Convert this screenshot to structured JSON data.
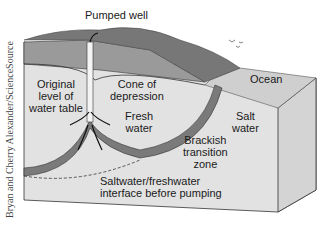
{
  "diagram": {
    "labels": {
      "pumped_well": "Pumped well",
      "ocean": "Ocean",
      "original_level": [
        "Original",
        "level of",
        "water table"
      ],
      "cone": [
        "Cone of",
        "depression"
      ],
      "fresh_water": [
        "Fresh",
        "water"
      ],
      "salt_water": [
        "Salt",
        "water"
      ],
      "brackish": [
        "Brackish",
        "transition",
        "zone"
      ],
      "interface": [
        "Saltwater/freshwater",
        "interface before pumping"
      ]
    },
    "credit": "Bryan and Cherry Alexander/ScienceSource",
    "colors": {
      "surface_soil": "#8c8c8c",
      "vegetation": "#6e6e6e",
      "fresh_water": "#d9d9d9",
      "salt_water": "#e6e6e6",
      "ocean": "#cfcfcf",
      "brackish_zone": "#7a7a7a",
      "outline": "#333333"
    }
  }
}
